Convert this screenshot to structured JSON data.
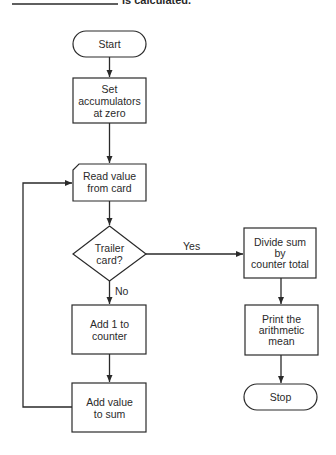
{
  "header": {
    "trailing_text": "is calculated."
  },
  "nodes": {
    "start": {
      "type": "terminal",
      "label": "Start"
    },
    "set_accumulators": {
      "type": "process",
      "lines": [
        "Set",
        "accumulators",
        "at zero"
      ]
    },
    "read_value": {
      "type": "card-input",
      "lines": [
        "Read value",
        "from card"
      ]
    },
    "trailer_decision": {
      "type": "decision",
      "lines": [
        "Trailer",
        "card?"
      ]
    },
    "add_counter": {
      "type": "process",
      "lines": [
        "Add 1 to",
        "counter"
      ]
    },
    "add_value": {
      "type": "process",
      "lines": [
        "Add value",
        "to sum"
      ]
    },
    "divide_sum": {
      "type": "process",
      "lines": [
        "Divide sum",
        "by",
        "counter total"
      ]
    },
    "print_mean": {
      "type": "process",
      "lines": [
        "Print the",
        "arithmetic",
        "mean"
      ]
    },
    "stop": {
      "type": "terminal",
      "label": "Stop"
    }
  },
  "edges": {
    "yes_label": "Yes",
    "no_label": "No"
  },
  "colors": {
    "stroke": "#2a2a2a",
    "background": "#ffffff"
  }
}
